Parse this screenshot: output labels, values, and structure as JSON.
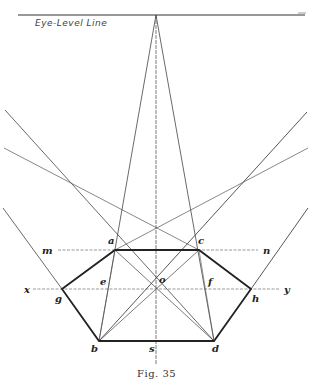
{
  "figure": {
    "eye_level_label": "Eye-Level Line",
    "caption": "Fig. 35",
    "points": {
      "a": "a",
      "b": "b",
      "c": "c",
      "d": "d",
      "e": "e",
      "f": "f",
      "g": "g",
      "h": "h",
      "o": "o",
      "s": "s",
      "m": "m",
      "n": "n",
      "x": "x",
      "y": "y"
    },
    "colors": {
      "line": "#333333",
      "background": "#ffffff"
    }
  }
}
